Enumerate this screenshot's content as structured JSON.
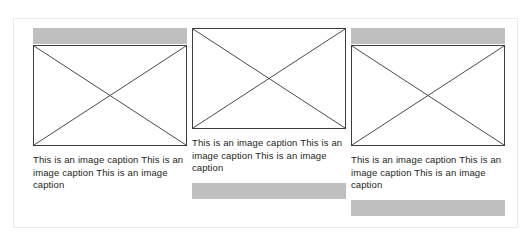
{
  "layout": {
    "column_count": 3,
    "panel_border_color": "#eceaea",
    "background_color": "#ffffff",
    "placeholder_bar_color": "#bfbfbf",
    "image_box_border_color": "#3c3c3c",
    "caption_text_color": "#231f20"
  },
  "columns": [
    {
      "id": "column-1",
      "top_bar": true,
      "bottom_bar": false,
      "image": {
        "type": "image-placeholder",
        "alt": "image-placeholder-crossed-box"
      },
      "caption": "This is an image caption This is an image caption This is an image caption"
    },
    {
      "id": "column-2",
      "top_bar": false,
      "bottom_bar": true,
      "image": {
        "type": "image-placeholder",
        "alt": "image-placeholder-crossed-box"
      },
      "caption": "This is an image caption This is an image caption This is an image caption"
    },
    {
      "id": "column-3",
      "top_bar": true,
      "bottom_bar": true,
      "image": {
        "type": "image-placeholder",
        "alt": "image-placeholder-crossed-box"
      },
      "caption": "This is an image caption This is an image caption This is an image caption"
    }
  ]
}
